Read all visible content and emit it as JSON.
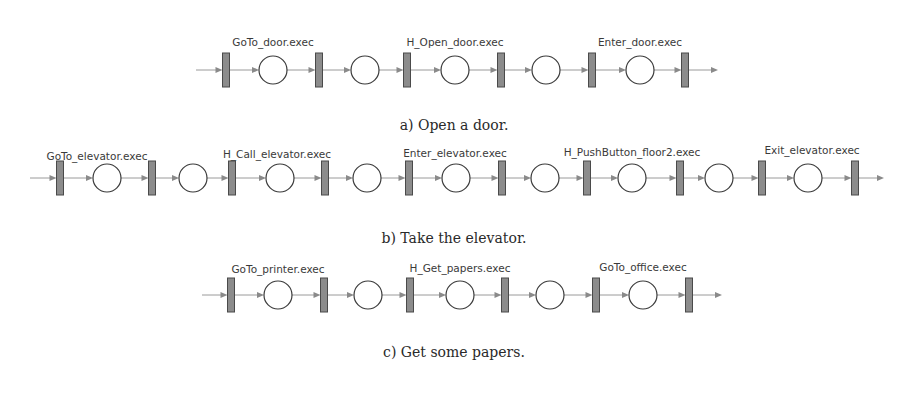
{
  "diagrams": [
    {
      "id": "a",
      "caption": "a) Open a door.",
      "row_y": 70,
      "start_x": 196,
      "end_x": 718,
      "transitions_x": [
        226,
        319,
        407,
        501,
        592,
        685
      ],
      "places_x": [
        273,
        365,
        455,
        546,
        640
      ],
      "labels": [
        {
          "text": "GoTo_door.exec",
          "x": 273,
          "y": 46
        },
        {
          "text": "H_Open_door.exec",
          "x": 455,
          "y": 46
        },
        {
          "text": "Enter_door.exec",
          "x": 640,
          "y": 46
        }
      ],
      "caption_y": 130
    },
    {
      "id": "b",
      "caption": "b) Take the elevator.",
      "row_y": 178,
      "start_x": 30,
      "end_x": 884,
      "transitions_x": [
        60,
        152,
        232,
        325,
        409,
        502,
        587,
        680,
        762,
        855
      ],
      "places_x": [
        107,
        193,
        280,
        367,
        456,
        545,
        632,
        719,
        808
      ],
      "labels": [
        {
          "text": "GoTo_elevator.exec",
          "x": 97,
          "y": 160
        },
        {
          "text": "H_Call_elevator.exec",
          "x": 277,
          "y": 158
        },
        {
          "text": "Enter_elevator.exec",
          "x": 455,
          "y": 157
        },
        {
          "text": "H_PushButton_floor2.exec",
          "x": 632,
          "y": 156
        },
        {
          "text": "Exit_elevator.exec",
          "x": 812,
          "y": 154
        }
      ],
      "caption_y": 243
    },
    {
      "id": "c",
      "caption": "c) Get some papers.",
      "row_y": 295,
      "start_x": 202,
      "end_x": 722,
      "transitions_x": [
        231,
        324,
        410,
        505,
        596,
        689
      ],
      "places_x": [
        278,
        368,
        460,
        550,
        643
      ],
      "labels": [
        {
          "text": "GoTo_printer.exec",
          "x": 278,
          "y": 273
        },
        {
          "text": "H_Get_papers.exec",
          "x": 460,
          "y": 272
        },
        {
          "text": "GoTo_office.exec",
          "x": 643,
          "y": 271
        }
      ],
      "caption_y": 357
    }
  ]
}
